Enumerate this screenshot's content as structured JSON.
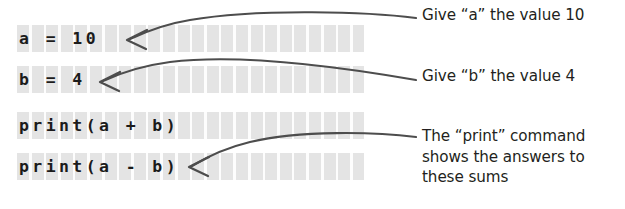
{
  "figure": {
    "background_color": "#ffffff",
    "code_text_color": "#1b1b1b",
    "code_stripe_color": "#e4e4e4",
    "annotation_text_color": "#231f20",
    "arrow_color": "#4d4d4d"
  },
  "code_block": {
    "lines": [
      {
        "text": "a = 10"
      },
      {
        "text": "b = 4"
      },
      {
        "text": "print(a + b)"
      },
      {
        "text": "print(a - b)"
      }
    ]
  },
  "annotations": [
    {
      "text": "Give “a” the value 10"
    },
    {
      "text": "Give “b” the value 4"
    },
    {
      "text": "The “print” command\nshows the answers to\nthese sums"
    }
  ],
  "arrows": [
    {
      "name": "arrow-to-line-1",
      "points_to": "a = 10"
    },
    {
      "name": "arrow-to-line-2",
      "points_to": "b = 4"
    },
    {
      "name": "arrow-to-line-4",
      "points_to": "print(a - b)"
    }
  ]
}
